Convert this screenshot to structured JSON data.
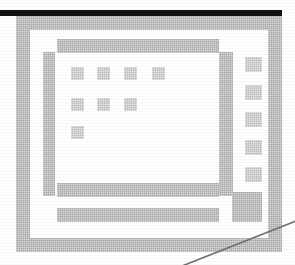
{
  "figure": {
    "kind": "ui-icon-bitmap",
    "canvas": {
      "width": 295,
      "height": 265,
      "background": "#ffffff"
    },
    "colors": {
      "chrome_grey": "#a9a9a9",
      "chrome_grey_light": "#bdbdbd",
      "window_fill": "#ffffff",
      "menubar_dark": "#121212",
      "menubar_soft": "#3a3a3a",
      "pointer_line": "#6f6f6f"
    }
  },
  "menubar": {
    "name": "top-dark-bar",
    "x": 0,
    "y": 10,
    "width": 282,
    "height": 6,
    "shadow": {
      "x": 16,
      "y": 16,
      "width": 266,
      "height": 3
    }
  },
  "outer_window": {
    "label": "outer-window-frame",
    "x": 16,
    "y": 16,
    "width": 266,
    "height": 236,
    "border": 14,
    "inner_gap": {
      "x": 30,
      "y": 30,
      "width": 238,
      "height": 208
    }
  },
  "mid_window": {
    "label": "mid-window-frame",
    "x": 43,
    "y": 43,
    "width": 190,
    "height": 178,
    "left_rail": {
      "x": 43,
      "y": 52,
      "width": 12,
      "height": 144
    },
    "right_rail": {
      "x": 219,
      "y": 52,
      "width": 14,
      "height": 144
    },
    "title_bar": {
      "x": 57,
      "y": 39,
      "width": 162,
      "height": 14
    }
  },
  "content_pane": {
    "label": "content-pane",
    "x": 55,
    "y": 53,
    "width": 164,
    "height": 130
  },
  "icon_grid": {
    "label": "icon-grid",
    "cell": 13,
    "rows": [
      {
        "row": 1,
        "count": 4,
        "y": 67,
        "xs": [
          71,
          97,
          124,
          152
        ]
      },
      {
        "row": 2,
        "count": 3,
        "y": 98,
        "xs": [
          71,
          97,
          124
        ]
      },
      {
        "row": 3,
        "count": 1,
        "y": 126,
        "xs": [
          71
        ]
      }
    ]
  },
  "side_toolbar": {
    "label": "right-button-column",
    "buttons": [
      {
        "name": "toolbar-button-1",
        "x": 245,
        "y": 57,
        "width": 17,
        "height": 15
      },
      {
        "name": "toolbar-button-2",
        "x": 245,
        "y": 85,
        "width": 17,
        "height": 15
      },
      {
        "name": "toolbar-button-3",
        "x": 245,
        "y": 112,
        "width": 17,
        "height": 15
      },
      {
        "name": "toolbar-button-4",
        "x": 245,
        "y": 140,
        "width": 17,
        "height": 15
      },
      {
        "name": "toolbar-button-5",
        "x": 245,
        "y": 167,
        "width": 17,
        "height": 15
      }
    ],
    "large_button": {
      "name": "toolbar-large-button",
      "x": 232,
      "y": 192,
      "width": 30,
      "height": 30
    }
  },
  "status_bars": [
    {
      "name": "status-bar-upper",
      "x": 57,
      "y": 183,
      "width": 162,
      "height": 14
    },
    {
      "name": "status-bar-lower",
      "x": 57,
      "y": 208,
      "width": 162,
      "height": 14
    }
  ],
  "pointer": {
    "label": "diagonal-pointer-line",
    "from": {
      "x": 182,
      "y": 266
    },
    "to": {
      "x": 296,
      "y": 221
    },
    "stroke": "#6f6f6f",
    "width": 1.6
  }
}
